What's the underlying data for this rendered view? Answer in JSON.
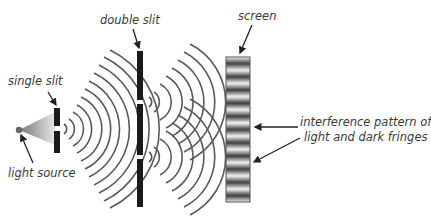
{
  "labels": {
    "single_slit": "single slit",
    "double_slit": "double slit",
    "screen": "screen",
    "light_source": "light source",
    "pattern_line1": "interference pattern of",
    "pattern_line2": "light and dark fringes"
  },
  "colors": {
    "barrier": "#1a1a1a",
    "wave": "#555555",
    "text": "#3a3a3a",
    "arrow": "#222222"
  },
  "components": [
    "light source",
    "single slit",
    "double slit",
    "screen"
  ]
}
